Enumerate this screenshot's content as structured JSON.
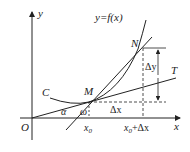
{
  "diagram": {
    "title": "y=f(x)",
    "axes": {
      "x_label": "x",
      "y_label": "y",
      "origin_label": "O"
    },
    "points": {
      "M": "M",
      "N": "N"
    },
    "curve_label": "C",
    "tangent_label": "T",
    "angles": {
      "alpha": "α",
      "omega": "ω"
    },
    "deltas": {
      "dx": "Δx",
      "dy": "Δy"
    },
    "ticks": {
      "x0": "x0",
      "x0_sub": "0",
      "x0dx_main": "x",
      "x0dx_sub": "0",
      "x0dx_rest": "+Δx"
    },
    "colors": {
      "stroke": "#222222",
      "background": "#ffffff"
    }
  }
}
